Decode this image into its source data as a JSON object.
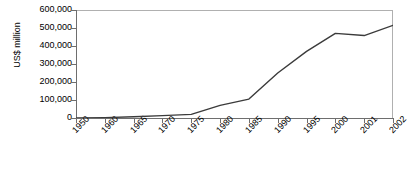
{
  "chart_data": {
    "type": "line",
    "title": "",
    "xlabel": "",
    "ylabel": "US$ million",
    "categories": [
      "1950",
      "1960",
      "1965",
      "1970",
      "1975",
      "1980",
      "1985",
      "1990",
      "1995",
      "2000",
      "2001",
      "2002"
    ],
    "values": [
      0,
      2000,
      7000,
      13000,
      20000,
      70000,
      105000,
      250000,
      370000,
      470000,
      458000,
      515000
    ],
    "ylim": [
      0,
      600000
    ],
    "ytick_labels": [
      "600,000",
      "500,000",
      "400,000",
      "300,000",
      "200,000",
      "100,000",
      "0"
    ],
    "ytick_values": [
      600000,
      500000,
      400000,
      300000,
      200000,
      100000,
      0
    ],
    "grid": false,
    "legend": "none",
    "series_color": "#3b3b3b",
    "axis_color": "#6e6e6e"
  }
}
